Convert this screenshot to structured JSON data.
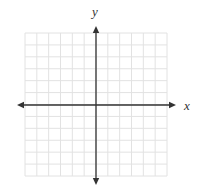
{
  "diagram": {
    "type": "coordinate-plane",
    "x_axis_label": "x",
    "y_axis_label": "y",
    "grid": {
      "columns": 12,
      "rows": 12,
      "left": 25,
      "top": 33,
      "width": 142,
      "height": 143,
      "line_color": "#e2e2e2"
    },
    "axes": {
      "origin_x": 96,
      "origin_y": 105,
      "x_arrow_left": 17,
      "x_arrow_right": 176,
      "y_arrow_top": 26,
      "y_arrow_bottom": 185,
      "color": "#333333"
    }
  }
}
